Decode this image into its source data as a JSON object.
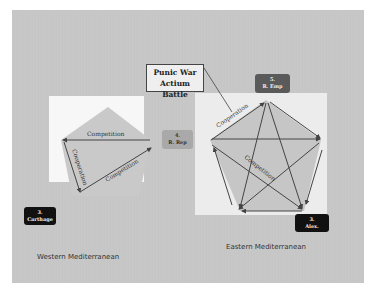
{
  "callout": {
    "line1": "Punic War",
    "line2": "Actium Battle"
  },
  "nodes": {
    "r_emp": {
      "line1": "5.",
      "line2": "R. Emp"
    },
    "r_rep": {
      "line1": "4.",
      "line2": "R. Rep"
    },
    "carthage": {
      "line1": "3.",
      "line2": "Carthage"
    },
    "alex": {
      "line1": "3.",
      "line2": "Alex."
    }
  },
  "regions": {
    "west": "Western Mediterranean",
    "east": "Eastern Mediterranean"
  },
  "edge_labels": {
    "west_top": "Competition",
    "west_left": "Cooperation",
    "west_diag": "Competition",
    "east_coop": "Cooperation",
    "east_center": "Competition"
  },
  "colors": {
    "slide_bg": "#c6c6c6",
    "dark_node": "#111111",
    "mid_node": "#5a5a5a",
    "light_node": "#a9a9a9",
    "arrow": "#444444"
  }
}
